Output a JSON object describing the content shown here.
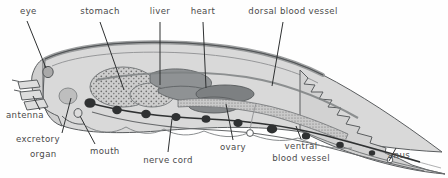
{
  "figure": {
    "kind": "biological-anatomy-diagram",
    "background_color": "#fefefe",
    "line_color": "#55585a",
    "label_color": "#4a4a4a",
    "body_fill": "#d6d6d6",
    "organ_fill": "#9a9a9a",
    "stipple_fill": "#c4c4c4"
  },
  "labels": [
    {
      "id": "eye",
      "text": "eye",
      "x": 20,
      "y": 12,
      "align": "left"
    },
    {
      "id": "stomach",
      "text": "stomach",
      "x": 100,
      "y": 12,
      "align": "center"
    },
    {
      "id": "liver",
      "text": "liver",
      "x": 160,
      "y": 12,
      "align": "center"
    },
    {
      "id": "heart",
      "text": "heart",
      "x": 203,
      "y": 12,
      "align": "center"
    },
    {
      "id": "dorsal-blood-vessel",
      "text": "dorsal blood vessel",
      "x": 293,
      "y": 12,
      "align": "center"
    },
    {
      "id": "antenna",
      "text": "antenna",
      "x": 8,
      "y": 115,
      "align": "left"
    },
    {
      "id": "excretory",
      "text": "excretory",
      "x": 18,
      "y": 140,
      "align": "left"
    },
    {
      "id": "organ",
      "text": "organ",
      "x": 30,
      "y": 155,
      "align": "left"
    },
    {
      "id": "mouth",
      "text": "mouth",
      "x": 92,
      "y": 152,
      "align": "left"
    },
    {
      "id": "nerve-cord",
      "text": "nerve cord",
      "x": 168,
      "y": 161,
      "align": "center"
    },
    {
      "id": "ovary",
      "text": "ovary",
      "x": 233,
      "y": 148,
      "align": "center"
    },
    {
      "id": "ventral",
      "text": "ventral",
      "x": 301,
      "y": 146,
      "align": "center"
    },
    {
      "id": "blood-vessel",
      "text": "blood vessel",
      "x": 301,
      "y": 158,
      "align": "center"
    },
    {
      "id": "anus",
      "text": "anus",
      "x": 399,
      "y": 156,
      "align": "center"
    }
  ],
  "structures": [
    "eye",
    "antenna",
    "excretory organ",
    "mouth",
    "stomach",
    "liver",
    "heart",
    "dorsal blood vessel",
    "nerve cord",
    "ovary",
    "ventral blood vessel",
    "anus"
  ]
}
